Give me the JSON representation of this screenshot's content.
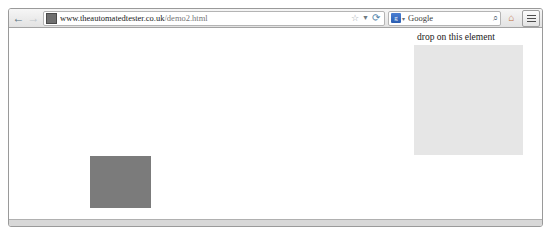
{
  "browser": {
    "toolbar": {
      "back_icon": "←",
      "forward_icon": "→",
      "back_name": "back-button",
      "forward_name": "forward-button",
      "url_host": "www.theautomatedtester.co.uk",
      "url_path": "/demo2.html",
      "bookmark_icon": "☆",
      "dropdown_icon": "▼",
      "reload_icon": "⟳",
      "search_engine_label": "g",
      "search_engine_arrow": "▾",
      "search_placeholder": "Google",
      "search_value": "Google",
      "search_magnifier_icon": "⌕",
      "home_icon": "⌂",
      "menu_label": ""
    }
  },
  "page": {
    "drop_target_label": "drop on this element",
    "drop_target_color": "#e6e6e6",
    "draggable_color": "#7b7b7b"
  }
}
